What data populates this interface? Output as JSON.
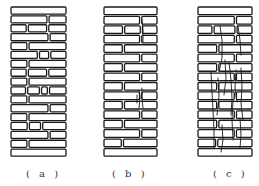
{
  "figure": {
    "panels": [
      {
        "id": "a",
        "label": "( a )",
        "x": 11,
        "width": 55,
        "label_x": 26,
        "courses": [
          [
            1.0
          ],
          [
            0.68,
            0.32
          ],
          [
            0.3,
            0.36,
            0.34
          ],
          [
            0.7,
            0.3
          ],
          [
            0.3,
            0.7
          ],
          [
            0.52,
            0.18,
            0.3
          ],
          [
            0.3,
            0.7
          ],
          [
            0.3,
            0.36,
            0.34
          ],
          [
            0.3,
            0.7
          ],
          [
            0.3,
            0.24,
            0.12,
            0.34
          ],
          [
            0.3,
            0.7
          ],
          [
            0.7,
            0.3
          ],
          [
            0.3,
            0.7
          ],
          [
            0.32,
            0.22,
            0.46
          ],
          [
            0.7,
            0.3
          ],
          [
            0.3,
            0.7
          ],
          [
            1.0
          ]
        ],
        "cracks": []
      },
      {
        "id": "b",
        "label": "( b )",
        "x": 104,
        "width": 53,
        "label_x": 112,
        "courses": [
          [
            1.0
          ],
          [
            0.7,
            0.3
          ],
          [
            0.38,
            0.32,
            0.3
          ],
          [
            0.7,
            0.3
          ],
          [
            0.36,
            0.64
          ],
          [
            0.7,
            0.3
          ],
          [
            0.36,
            0.64
          ],
          [
            0.7,
            0.3
          ],
          [
            0.36,
            0.64
          ],
          [
            0.7,
            0.3
          ],
          [
            0.36,
            0.64
          ],
          [
            0.7,
            0.3
          ],
          [
            0.36,
            0.64
          ],
          [
            0.7,
            0.3
          ],
          [
            0.34,
            0.66
          ],
          [
            1.0
          ]
        ],
        "cracks": [
          "M142,20 L143,30 L143,42",
          "M139,90 L140,98 L139,108",
          "M142,88 L142,98 L143,108",
          "M137,95 L137,103"
        ]
      },
      {
        "id": "c",
        "label": "( c )",
        "x": 198,
        "width": 54,
        "label_x": 213,
        "courses": [
          [
            1.0
          ],
          [
            0.7,
            0.3
          ],
          [
            0.28,
            0.42,
            0.3
          ],
          [
            0.7,
            0.3
          ],
          [
            0.36,
            0.64
          ],
          [
            0.7,
            0.3
          ],
          [
            0.36,
            0.64
          ],
          [
            0.7,
            0.3
          ],
          [
            0.36,
            0.64
          ],
          [
            0.7,
            0.3
          ],
          [
            0.36,
            0.64
          ],
          [
            0.7,
            0.3
          ],
          [
            0.36,
            0.64
          ],
          [
            0.7,
            0.3
          ],
          [
            0.34,
            0.66
          ],
          [
            1.0
          ]
        ],
        "cracks": [
          "M220,26 L222,40 L222,58 L219,72",
          "M238,26 L240,40 L241,55",
          "M225,60 L226,78 L224,95",
          "M229,62 L231,80 L232,98 L231,115",
          "M236,70 L235,88 L237,102",
          "M241,68 L242,86 L241,104 L243,120",
          "M211,72 L212,92 L213,110 L214,130 L214,148",
          "M218,78 L219,96 L217,115",
          "M233,100 L232,120 L233,140",
          "M240,118 L241,135 L240,148",
          "M222,125 L223,140 L221,152"
        ]
      }
    ],
    "top_y": 7,
    "course_height": 9.4,
    "course_gap": 1.8
  }
}
